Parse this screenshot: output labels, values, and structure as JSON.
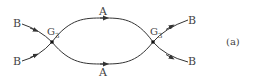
{
  "diagram": {
    "caption": "(a)",
    "vertices": [
      {
        "label": "G",
        "subscript": "3"
      },
      {
        "label": "G",
        "subscript": "3"
      }
    ],
    "incoming": [
      "B",
      "B"
    ],
    "internal": {
      "top": "A",
      "bottom": "A"
    },
    "outgoing": [
      "B",
      "B"
    ],
    "line_color": "#333333"
  }
}
